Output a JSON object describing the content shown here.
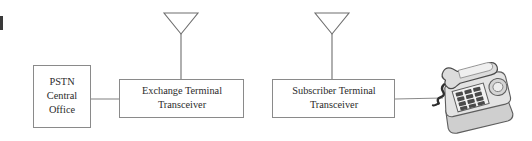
{
  "diagram": {
    "background_color": "#ffffff",
    "line_color": "#8a8a8a",
    "text_color": "#2b2b2b",
    "nodes": [
      {
        "id": "pstn",
        "name": "pstn-central-office",
        "lines": [
          "PSTN",
          "Central",
          "Office"
        ],
        "x": 33,
        "y": 65,
        "width": 58,
        "height": 63
      },
      {
        "id": "exchange",
        "name": "exchange-terminal-transceiver",
        "lines": [
          "Exchange Terminal",
          "Transceiver"
        ],
        "x": 119,
        "y": 79,
        "width": 125,
        "height": 39
      },
      {
        "id": "subscriber",
        "name": "subscriber-terminal-transceiver",
        "lines": [
          "Subscriber Terminal",
          "Transceiver"
        ],
        "x": 272,
        "y": 79,
        "width": 123,
        "height": 39
      }
    ],
    "antennas": [
      {
        "id": "exchange-antenna",
        "name": "exchange-antenna",
        "mast_x": 181,
        "mast_top": 33,
        "mast_bottom": 79,
        "tri_left": 164,
        "tri_right": 198,
        "tri_top": 13,
        "tri_apex_y": 34
      },
      {
        "id": "subscriber-antenna",
        "name": "subscriber-antenna",
        "mast_x": 332,
        "mast_top": 33,
        "mast_bottom": 79,
        "tri_left": 315,
        "tri_right": 349,
        "tri_top": 13,
        "tri_apex_y": 34
      }
    ],
    "links": [
      {
        "id": "pstn-to-exchange",
        "name": "link-pstn-to-exchange",
        "x1": 91,
        "y1": 99,
        "x2": 119,
        "y2": 99
      },
      {
        "id": "subscriber-to-telephone",
        "name": "link-subscriber-to-telephone",
        "x1": 395,
        "y1": 99,
        "x2": 441,
        "y2": 98
      }
    ],
    "telephone": {
      "id": "telephone",
      "name": "desk-telephone",
      "x": 434,
      "y": 60,
      "width": 86,
      "height": 72,
      "body_color": "#d8d8d8",
      "shade_color": "#a9a9a9",
      "key_color": "#4a4a4a"
    },
    "edge_artifact": {
      "name": "page-edge-mark",
      "x": 0,
      "y": 16,
      "width": 3,
      "height": 14
    }
  }
}
